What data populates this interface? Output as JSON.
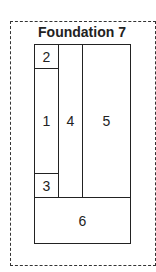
{
  "diagram": {
    "title": "Foundation 7",
    "regions": [
      {
        "id": "2",
        "label": "2"
      },
      {
        "id": "1",
        "label": "1"
      },
      {
        "id": "3",
        "label": "3"
      },
      {
        "id": "4",
        "label": "4"
      },
      {
        "id": "5",
        "label": "5"
      },
      {
        "id": "6",
        "label": "6"
      }
    ]
  }
}
